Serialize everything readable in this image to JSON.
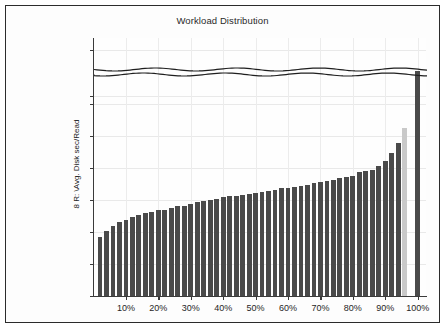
{
  "chart_data": {
    "type": "bar",
    "title": "Workload Distribution",
    "xlabel": "",
    "ylabel": "8 R: \\Avg. Disk sec/Read",
    "ylim": [
      0.0,
      0.088
    ],
    "grid": true,
    "legend": false,
    "axis_break": {
      "present": true,
      "lower_max": 0.03,
      "upper_min": 0.086,
      "style": "double-wavy-line"
    },
    "y_ticks": [
      "0.000",
      "0.005",
      "0.010",
      "0.015",
      "0.020",
      "0.025",
      "0.030",
      "0.086",
      "0.088"
    ],
    "y_tick_values": [
      0.0,
      0.005,
      0.01,
      0.015,
      0.02,
      0.025,
      0.03,
      0.086,
      0.088
    ],
    "x_ticks": [
      "10%",
      "20%",
      "30%",
      "40%",
      "50%",
      "60%",
      "70%",
      "80%",
      "90%",
      "100%"
    ],
    "x_tick_values": [
      10,
      20,
      30,
      40,
      50,
      60,
      70,
      80,
      90,
      100
    ],
    "categories": [
      "2%",
      "4%",
      "6%",
      "8%",
      "10%",
      "12%",
      "14%",
      "16%",
      "18%",
      "20%",
      "22%",
      "24%",
      "26%",
      "28%",
      "30%",
      "32%",
      "34%",
      "36%",
      "38%",
      "40%",
      "42%",
      "44%",
      "46%",
      "48%",
      "50%",
      "52%",
      "54%",
      "56%",
      "58%",
      "60%",
      "62%",
      "64%",
      "66%",
      "68%",
      "70%",
      "72%",
      "74%",
      "76%",
      "78%",
      "80%",
      "82%",
      "84%",
      "86%",
      "88%",
      "90%",
      "92%",
      "94%",
      "96%",
      "98%",
      "100%"
    ],
    "values": [
      0.0092,
      0.0102,
      0.0109,
      0.0115,
      0.0119,
      0.0123,
      0.0127,
      0.0129,
      0.0132,
      0.0134,
      0.0135,
      0.0138,
      0.014,
      0.0141,
      0.0144,
      0.0147,
      0.0149,
      0.015,
      0.0151,
      0.0154,
      0.0156,
      0.0157,
      0.0158,
      0.016,
      0.0161,
      0.0162,
      0.0164,
      0.0166,
      0.0168,
      0.0169,
      0.0171,
      0.0172,
      0.0174,
      0.0177,
      0.0178,
      0.018,
      0.0182,
      0.0184,
      0.0186,
      0.0188,
      0.0193,
      0.0195,
      0.0197,
      0.0203,
      0.0211,
      0.0224,
      0.0239,
      0.0262,
      0.0303,
      0.0871
    ],
    "bar_colors": [
      "dark",
      "dark",
      "dark",
      "dark",
      "dark",
      "dark",
      "dark",
      "dark",
      "dark",
      "dark",
      "dark",
      "dark",
      "dark",
      "dark",
      "dark",
      "dark",
      "dark",
      "dark",
      "dark",
      "dark",
      "dark",
      "dark",
      "dark",
      "dark",
      "dark",
      "dark",
      "dark",
      "dark",
      "dark",
      "dark",
      "dark",
      "dark",
      "dark",
      "dark",
      "dark",
      "dark",
      "dark",
      "dark",
      "dark",
      "dark",
      "dark",
      "dark",
      "dark",
      "dark",
      "dark",
      "dark",
      "dark",
      "light",
      "dark",
      "dark"
    ],
    "colors": {
      "bar_dark": "#4a4a4a",
      "bar_light": "#c9c9c9",
      "axis": "#3a3a3a",
      "grid": "#e9e9e9",
      "text": "#262626",
      "frame": "#2b2b2b",
      "background": "#fdfdfd"
    }
  }
}
